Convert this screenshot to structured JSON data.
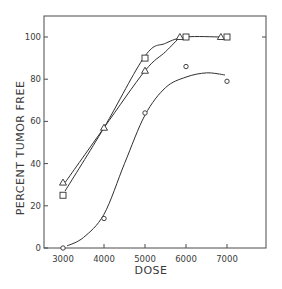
{
  "chart_data": {
    "type": "line",
    "title": "",
    "xlabel": "DOSE",
    "ylabel": "PERCENT TUMOR FREE",
    "xlim": [
      2500,
      8000
    ],
    "ylim": [
      0,
      110
    ],
    "x_ticks": [
      3000,
      4000,
      5000,
      6000,
      7000
    ],
    "x_tick_labels": [
      "3000",
      "4000",
      "5000",
      "6000",
      "7000"
    ],
    "y_ticks": [
      0,
      20,
      40,
      60,
      80,
      100
    ],
    "y_tick_labels": [
      "0",
      "20",
      "40",
      "60",
      "80",
      "100"
    ],
    "grid": false,
    "legend": null,
    "series": [
      {
        "name": "square",
        "marker": "square",
        "points": [
          [
            3000,
            25
          ],
          [
            5000,
            90
          ],
          [
            6000,
            100
          ],
          [
            7000,
            100
          ]
        ]
      },
      {
        "name": "triangle",
        "marker": "triangle",
        "points": [
          [
            3000,
            31
          ],
          [
            4000,
            57
          ],
          [
            5000,
            84
          ],
          [
            5850,
            100
          ],
          [
            6850,
            100
          ]
        ]
      },
      {
        "name": "circle",
        "marker": "circle",
        "points": [
          [
            3000,
            0
          ],
          [
            4000,
            14
          ],
          [
            5000,
            64
          ],
          [
            6000,
            86
          ],
          [
            7000,
            79
          ]
        ]
      }
    ],
    "fitted_curves": [
      {
        "name": "square-fit",
        "path": [
          [
            3050,
            27
          ],
          [
            4000,
            57
          ],
          [
            5000,
            91
          ],
          [
            5500,
            97
          ],
          [
            6000,
            100
          ],
          [
            6850,
            100
          ]
        ]
      },
      {
        "name": "triangle-fit",
        "path": [
          [
            3050,
            31
          ],
          [
            4000,
            57
          ],
          [
            5000,
            84
          ],
          [
            5500,
            93
          ],
          [
            5850,
            100
          ]
        ]
      },
      {
        "name": "circle-fit",
        "path": [
          [
            3100,
            1
          ],
          [
            3500,
            5
          ],
          [
            4000,
            16
          ],
          [
            4500,
            40
          ],
          [
            5000,
            63
          ],
          [
            5500,
            76
          ],
          [
            6000,
            81
          ],
          [
            6500,
            83
          ],
          [
            6950,
            82
          ]
        ]
      }
    ]
  },
  "labels": {
    "xlabel": "DOSE",
    "ylabel": "PERCENT TUMOR FREE"
  },
  "colors": {
    "line": "#2e2e2e",
    "text": "#3a3a3a",
    "background": "#ffffff"
  }
}
